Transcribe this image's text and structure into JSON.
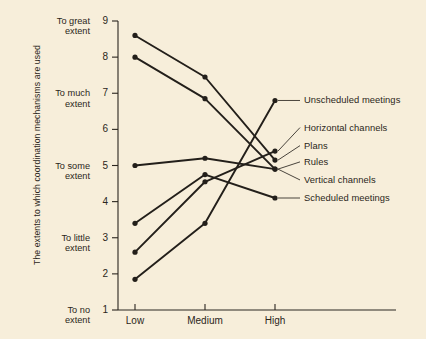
{
  "chart_data": {
    "type": "line",
    "title": "",
    "xlabel": "",
    "ylabel": "The extents to which coordination mechanisms are used",
    "categories": [
      "Low",
      "Medium",
      "High"
    ],
    "x": [
      1,
      2,
      3
    ],
    "ylim": [
      1,
      9
    ],
    "xlim": [
      0.5,
      3.5
    ],
    "grid": false,
    "legend_position": "right-inline-labels",
    "y_ticks": [
      1,
      2,
      3,
      4,
      5,
      6,
      7,
      8,
      9
    ],
    "y_tick_labels": [
      "1",
      "2",
      "3",
      "4",
      "5",
      "6",
      "7",
      "8",
      "9"
    ],
    "y_category_labels": [
      {
        "value": 9,
        "line1": "To great",
        "line2": "extent"
      },
      {
        "value": 7,
        "line1": "To much",
        "line2": "extent"
      },
      {
        "value": 5,
        "line1": "To some",
        "line2": "extent"
      },
      {
        "value": 3,
        "line1": "To little",
        "line2": "extent"
      },
      {
        "value": 1,
        "line1": "To no",
        "line2": "extent"
      }
    ],
    "series": [
      {
        "name": "Unscheduled meetings",
        "values": [
          1.85,
          3.4,
          6.8
        ],
        "label_y": 6.8
      },
      {
        "name": "Horizontal channels",
        "values": [
          2.6,
          4.55,
          5.4
        ],
        "label_y": 6.05
      },
      {
        "name": "Plans",
        "values": [
          8.6,
          7.45,
          5.15
        ],
        "label_y": 5.55
      },
      {
        "name": "Rules",
        "values": [
          8.0,
          6.85,
          4.9
        ],
        "label_y": 5.1
      },
      {
        "name": "Vertical channels",
        "values": [
          5.0,
          5.2,
          4.9
        ],
        "label_y": 4.6
      },
      {
        "name": "Scheduled meetings",
        "values": [
          3.4,
          4.75,
          4.1
        ],
        "label_y": 4.1
      }
    ]
  },
  "colors": {
    "background": "#f7eeda",
    "ink": "#2b2620",
    "line": "#231f1a",
    "leader": "#2b2620"
  }
}
